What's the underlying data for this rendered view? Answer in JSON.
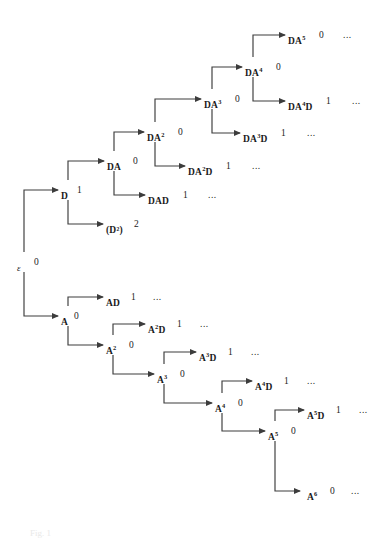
{
  "figure": {
    "background_color": "#ffffff",
    "line_color": "#3c3c3c",
    "text_color": "#1a1a1a",
    "caption": "Fig. 1"
  },
  "ellipsis": "...",
  "nodes": [
    {
      "id": "root",
      "label": "ε",
      "sup": "",
      "value": "0",
      "ellipsis": "",
      "x": 17,
      "y": 258,
      "value_dx": 17,
      "ell_dx": 0,
      "italic": true
    },
    {
      "id": "D",
      "label": "D",
      "sup": "",
      "value": "1",
      "ellipsis": "",
      "x": 61,
      "y": 186,
      "value_dx": 16,
      "ell_dx": 0,
      "italic": false
    },
    {
      "id": "D2",
      "label": "(D²)",
      "sup": "",
      "value": "2",
      "ellipsis": "",
      "x": 106,
      "y": 220,
      "value_dx": 28,
      "ell_dx": 0,
      "italic": false
    },
    {
      "id": "DA",
      "label": "DA",
      "sup": "",
      "value": "0",
      "ellipsis": "",
      "x": 107,
      "y": 157,
      "value_dx": 26,
      "ell_dx": 0,
      "italic": false
    },
    {
      "id": "DAD",
      "label": "DAD",
      "sup": "",
      "value": "1",
      "ellipsis": "...",
      "x": 148,
      "y": 191,
      "value_dx": 35,
      "ell_dx": 60,
      "italic": false
    },
    {
      "id": "DA2",
      "label": "DA",
      "sup": "2",
      "value": "0",
      "ellipsis": "",
      "x": 147,
      "y": 128,
      "value_dx": 31,
      "ell_dx": 0,
      "italic": false
    },
    {
      "id": "DA2D",
      "label": "DA",
      "sup": "2",
      "value": "1",
      "ellipsis": "...",
      "x": 188,
      "y": 162,
      "value_dx": 38,
      "ell_dx": 64,
      "italic": false,
      "suffix": "D"
    },
    {
      "id": "DA3",
      "label": "DA",
      "sup": "3",
      "value": "0",
      "ellipsis": "",
      "x": 204,
      "y": 95,
      "value_dx": 31,
      "ell_dx": 0,
      "italic": false
    },
    {
      "id": "DA3D",
      "label": "DA",
      "sup": "3",
      "value": "1",
      "ellipsis": "...",
      "x": 243,
      "y": 129,
      "value_dx": 38,
      "ell_dx": 64,
      "italic": false,
      "suffix": "D"
    },
    {
      "id": "DA4",
      "label": "DA",
      "sup": "4",
      "value": "0",
      "ellipsis": "",
      "x": 245,
      "y": 63,
      "value_dx": 31,
      "ell_dx": 0,
      "italic": false
    },
    {
      "id": "DA4D",
      "label": "DA",
      "sup": "4",
      "value": "1",
      "ellipsis": "...",
      "x": 288,
      "y": 97,
      "value_dx": 38,
      "ell_dx": 64,
      "italic": false,
      "suffix": "D"
    },
    {
      "id": "DA5",
      "label": "DA",
      "sup": "5",
      "value": "0",
      "ellipsis": "...",
      "x": 288,
      "y": 31,
      "value_dx": 31,
      "ell_dx": 55,
      "italic": false
    },
    {
      "id": "A",
      "label": "A",
      "sup": "",
      "value": "0",
      "ellipsis": "",
      "x": 61,
      "y": 312,
      "value_dx": 13,
      "ell_dx": 0,
      "italic": false
    },
    {
      "id": "AD",
      "label": "AD",
      "sup": "",
      "value": "1",
      "ellipsis": "...",
      "x": 106,
      "y": 293,
      "value_dx": 25,
      "ell_dx": 47,
      "italic": false
    },
    {
      "id": "A2",
      "label": "A",
      "sup": "2",
      "value": "0",
      "ellipsis": "",
      "x": 106,
      "y": 341,
      "value_dx": 23,
      "ell_dx": 0,
      "italic": false
    },
    {
      "id": "A2D",
      "label": "A",
      "sup": "2",
      "value": "1",
      "ellipsis": "...",
      "x": 148,
      "y": 320,
      "value_dx": 29,
      "ell_dx": 52,
      "italic": false,
      "suffix": "D"
    },
    {
      "id": "A3",
      "label": "A",
      "sup": "3",
      "value": "0",
      "ellipsis": "",
      "x": 157,
      "y": 370,
      "value_dx": 23,
      "ell_dx": 0,
      "italic": false
    },
    {
      "id": "A3D",
      "label": "A",
      "sup": "3",
      "value": "1",
      "ellipsis": "...",
      "x": 199,
      "y": 348,
      "value_dx": 29,
      "ell_dx": 52,
      "italic": false,
      "suffix": "D"
    },
    {
      "id": "A4",
      "label": "A",
      "sup": "4",
      "value": "0",
      "ellipsis": "",
      "x": 215,
      "y": 399,
      "value_dx": 23,
      "ell_dx": 0,
      "italic": false
    },
    {
      "id": "A4D",
      "label": "A",
      "sup": "4",
      "value": "1",
      "ellipsis": "...",
      "x": 255,
      "y": 377,
      "value_dx": 29,
      "ell_dx": 52,
      "italic": false,
      "suffix": "D"
    },
    {
      "id": "A5",
      "label": "A",
      "sup": "5",
      "value": "0",
      "ellipsis": "",
      "x": 268,
      "y": 427,
      "value_dx": 23,
      "ell_dx": 0,
      "italic": false
    },
    {
      "id": "A5D",
      "label": "A",
      "sup": "5",
      "value": "1",
      "ellipsis": "...",
      "x": 307,
      "y": 406,
      "value_dx": 29,
      "ell_dx": 52,
      "italic": false,
      "suffix": "D"
    },
    {
      "id": "A6",
      "label": "A",
      "sup": "6",
      "value": "0",
      "ellipsis": "...",
      "x": 307,
      "y": 487,
      "value_dx": 23,
      "ell_dx": 44,
      "italic": false
    }
  ],
  "edges": [
    {
      "id": "root-D",
      "from": "root",
      "to": "D",
      "ox": 24,
      "oy": 252,
      "ey": 190,
      "ex": 58
    },
    {
      "id": "root-A",
      "from": "root",
      "to": "A",
      "ox": 24,
      "oy": 272,
      "ey": 316,
      "ex": 58
    },
    {
      "id": "D-DA",
      "from": "D",
      "to": "DA",
      "ox": 68,
      "oy": 180,
      "ey": 161,
      "ex": 104
    },
    {
      "id": "D-D2",
      "from": "D",
      "to": "D2",
      "ox": 68,
      "oy": 200,
      "ey": 224,
      "ex": 103
    },
    {
      "id": "DA-DA2",
      "from": "DA",
      "to": "DA2",
      "ox": 114,
      "oy": 151,
      "ey": 132,
      "ex": 144
    },
    {
      "id": "DA-DAD",
      "from": "DA",
      "to": "DAD",
      "ox": 114,
      "oy": 171,
      "ey": 195,
      "ex": 145
    },
    {
      "id": "DA2-DA3",
      "from": "DA2",
      "to": "DA3",
      "ox": 155,
      "oy": 122,
      "ey": 99,
      "ex": 201
    },
    {
      "id": "DA2-DA2D",
      "from": "DA2",
      "to": "DA2D",
      "ox": 155,
      "oy": 142,
      "ey": 166,
      "ex": 185
    },
    {
      "id": "DA3-DA4",
      "from": "DA3",
      "to": "DA4",
      "ox": 212,
      "oy": 89,
      "ey": 67,
      "ex": 242
    },
    {
      "id": "DA3-DA3D",
      "from": "DA3",
      "to": "DA3D",
      "ox": 212,
      "oy": 109,
      "ey": 133,
      "ex": 240
    },
    {
      "id": "DA4-DA5",
      "from": "DA4",
      "to": "DA5",
      "ox": 253,
      "oy": 57,
      "ey": 35,
      "ex": 285
    },
    {
      "id": "DA4-DA4D",
      "from": "DA4",
      "to": "DA4D",
      "ox": 253,
      "oy": 77,
      "ey": 101,
      "ex": 285
    },
    {
      "id": "A-AD",
      "from": "A",
      "to": "AD",
      "ox": 68,
      "oy": 306,
      "ey": 297,
      "ex": 103
    },
    {
      "id": "A-A2",
      "from": "A",
      "to": "A2",
      "ox": 68,
      "oy": 326,
      "ey": 345,
      "ex": 103
    },
    {
      "id": "A2-A2D",
      "from": "A2",
      "to": "A2D",
      "ox": 113,
      "oy": 335,
      "ey": 324,
      "ex": 145
    },
    {
      "id": "A2-A3",
      "from": "A2",
      "to": "A3",
      "ox": 113,
      "oy": 355,
      "ey": 374,
      "ex": 154
    },
    {
      "id": "A3-A3D",
      "from": "A3",
      "to": "A3D",
      "ox": 164,
      "oy": 364,
      "ey": 352,
      "ex": 196
    },
    {
      "id": "A3-A4",
      "from": "A3",
      "to": "A4",
      "ox": 164,
      "oy": 384,
      "ey": 403,
      "ex": 212
    },
    {
      "id": "A4-A4D",
      "from": "A4",
      "to": "A4D",
      "ox": 222,
      "oy": 393,
      "ey": 381,
      "ex": 252
    },
    {
      "id": "A4-A5",
      "from": "A4",
      "to": "A5",
      "ox": 222,
      "oy": 413,
      "ey": 431,
      "ex": 265
    },
    {
      "id": "A5-A5D",
      "from": "A5",
      "to": "A5D",
      "ox": 275,
      "oy": 421,
      "ey": 410,
      "ex": 304
    },
    {
      "id": "A5-A6",
      "from": "A5",
      "to": "A6",
      "ox": 275,
      "oy": 441,
      "ey": 491,
      "ex": 300
    }
  ]
}
